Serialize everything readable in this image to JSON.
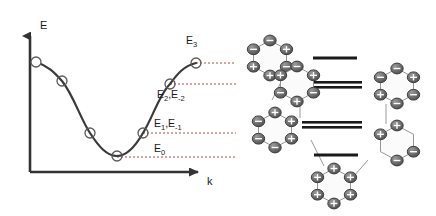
{
  "figure": {
    "background_color": "#ffffff"
  },
  "left_panel": {
    "name": "band-dispersion-plot",
    "axes": {
      "y_label": "E",
      "x_label": "k",
      "axis_color": "#333333",
      "origin_px": [
        30,
        172
      ],
      "y_top_px": [
        30,
        30
      ],
      "x_right_px": [
        205,
        172
      ]
    },
    "curve": {
      "color": "#333333",
      "description": "cosine-like band dispersion, maximum at left edge, minimum near centre, rising to maximum at right"
    },
    "markers": {
      "shape": "open-circle",
      "stroke": "#555555",
      "fill": "none",
      "radius_px": 5
    },
    "dashed_line_color": "#b04a4a",
    "level_labels": [
      {
        "id": "E3",
        "text": "E",
        "sub": "3"
      },
      {
        "id": "E2",
        "text": "E",
        "sub": "2",
        "text2": ",E",
        "sub2": "-2"
      },
      {
        "id": "E1",
        "text": "E",
        "sub": "1",
        "text2": ",E",
        "sub2": "-1"
      },
      {
        "id": "E0",
        "text": "E",
        "sub": "0"
      }
    ]
  },
  "right_panel": {
    "name": "huckel-mo-diagram",
    "energy_levels": [
      {
        "id": "level-3",
        "label": "E3",
        "degeneracy": 1,
        "y_px": 58,
        "bars": [
          {
            "x1": 313,
            "x2": 357,
            "y": 58
          }
        ]
      },
      {
        "id": "level-2",
        "label": "E2,E-2",
        "degeneracy": 2,
        "y_px": 84,
        "bars": [
          {
            "x1": 296,
            "x2": 362,
            "y": 82
          },
          {
            "x1": 296,
            "x2": 362,
            "y": 87
          }
        ]
      },
      {
        "id": "level-1",
        "label": "E1,E-1",
        "degeneracy": 2,
        "y_px": 124,
        "bars": [
          {
            "x1": 302,
            "x2": 362,
            "y": 122
          },
          {
            "x1": 302,
            "x2": 362,
            "y": 127
          }
        ]
      },
      {
        "id": "level-0",
        "label": "E0",
        "degeneracy": 1,
        "y_px": 155,
        "bars": [
          {
            "x1": 314,
            "x2": 358,
            "y": 155
          }
        ]
      }
    ],
    "bar_color": "#1a1a1a",
    "orbital_color_positive": "#6e6e6e",
    "orbital_color_negative": "#4a4a4a",
    "ring_stroke": "#8a8a8a",
    "lobe_sign_positive": "+",
    "lobe_sign_negative": "−",
    "rings": [
      {
        "id": "ring-top-left",
        "cx": 270,
        "cy": 58,
        "signs": [
          "-",
          "+",
          "+",
          "-",
          "-",
          "+"
        ]
      },
      {
        "id": "ring-upper-mid",
        "cx": 297,
        "cy": 84,
        "signs": [
          "-",
          "+",
          "-",
          "+",
          "-",
          "+"
        ]
      },
      {
        "id": "ring-left-mid",
        "cx": 275,
        "cy": 130,
        "signs": [
          "+",
          "-",
          "-",
          "-",
          "+",
          "+"
        ]
      },
      {
        "id": "ring-bottom-mid",
        "cx": 334,
        "cy": 186,
        "signs": [
          "+",
          "+",
          "+",
          "+",
          "+",
          "+"
        ]
      },
      {
        "id": "ring-right-upper",
        "cx": 397,
        "cy": 86,
        "signs": [
          "-",
          "-",
          "+",
          "-",
          "-",
          "+"
        ]
      },
      {
        "id": "ring-right-lower",
        "cx": 397,
        "cy": 143,
        "signs": [
          "-",
          "-",
          "",
          "+",
          "+",
          ""
        ]
      }
    ]
  },
  "chart_data": {
    "type": "line",
    "title": "",
    "xlabel": "k",
    "ylabel": "E",
    "x": [
      0,
      1,
      2,
      3,
      4,
      5,
      6
    ],
    "y": [
      1.0,
      0.77,
      0.24,
      0.0,
      0.24,
      0.77,
      1.0
    ],
    "point_labels": [
      "E3",
      "E2,E-2",
      "E1,E-1",
      "E0",
      "E1,E-1",
      "E2,E-2",
      "E3"
    ],
    "marker_px": [
      [
        36,
        62
      ],
      [
        62,
        81
      ],
      [
        90,
        133
      ],
      [
        117,
        156
      ],
      [
        143,
        133
      ],
      [
        170,
        84
      ],
      [
        196,
        63
      ]
    ],
    "level_lines_px": [
      63,
      84,
      133,
      157
    ],
    "grid": false,
    "legend": "none",
    "xlim": [
      0,
      6
    ],
    "ylim": [
      0,
      1.05
    ]
  }
}
